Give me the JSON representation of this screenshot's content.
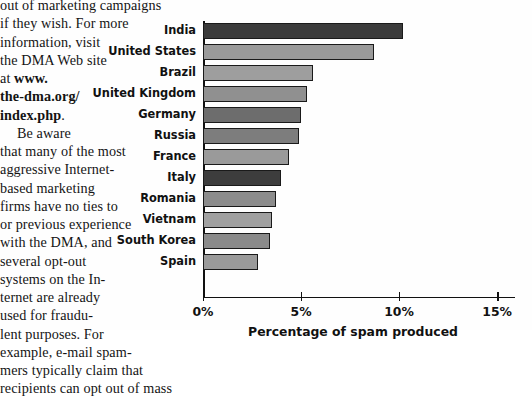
{
  "article": {
    "lines": [
      "out of marketing campaigns",
      "if they wish. For more",
      "information, visit",
      "the DMA Web site",
      "at "
    ],
    "url_part_1": "www.",
    "url_part_2": "the-dma.org/",
    "url_part_3": "index.php",
    "url_end": ".",
    "paragraph2": [
      "Be aware",
      "that many of the most",
      "aggressive Internet-",
      "based marketing",
      "firms have no ties to",
      "or previous experience",
      "with the DMA, and",
      "several opt-out",
      "systems on the In-",
      "ternet are already",
      "used for fraudu-",
      "lent purposes. For",
      "example, e-mail spam-",
      "mers typically claim that",
      "recipients can opt out of mass"
    ]
  },
  "chart_data": {
    "type": "bar",
    "orientation": "horizontal",
    "title": "",
    "xlabel": "Percentage of spam produced",
    "ylabel": "",
    "xlim": [
      0,
      15.3
    ],
    "xticks": [
      0,
      5,
      10,
      15
    ],
    "xtick_labels": [
      "0%",
      "5%",
      "10%",
      "15%"
    ],
    "grid": false,
    "categories": [
      "India",
      "United States",
      "Brazil",
      "United Kingdom",
      "Germany",
      "Russia",
      "France",
      "Italy",
      "Romania",
      "Vietnam",
      "South Korea",
      "Spain"
    ],
    "values": [
      10.2,
      8.7,
      5.6,
      5.3,
      5.0,
      4.9,
      4.4,
      4.0,
      3.7,
      3.5,
      3.4,
      2.8
    ],
    "bar_colors": [
      "#3b3b3b",
      "#9a9a9a",
      "#9e9e9e",
      "#909090",
      "#6d6d6d",
      "#7d7d7d",
      "#9a9a9a",
      "#3d3d3d",
      "#8c8c8c",
      "#a0a0a0",
      "#8a8a8a",
      "#9a9a9a"
    ]
  }
}
